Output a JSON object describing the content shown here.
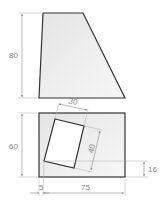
{
  "drawing": {
    "front_view": {
      "shape": "trapezoid",
      "height_label": "80"
    },
    "top_view": {
      "shape": "rectangle",
      "height_label": "60",
      "width_label": "75",
      "offset_label": "5",
      "inner_offset_label": "16",
      "inner_rect": {
        "width_label": "30",
        "height_label": "40"
      }
    },
    "colors": {
      "outline": "#333333",
      "fill_light": "#ececec",
      "fill_white": "#ffffff",
      "dimension": "#8a8a8a"
    }
  }
}
